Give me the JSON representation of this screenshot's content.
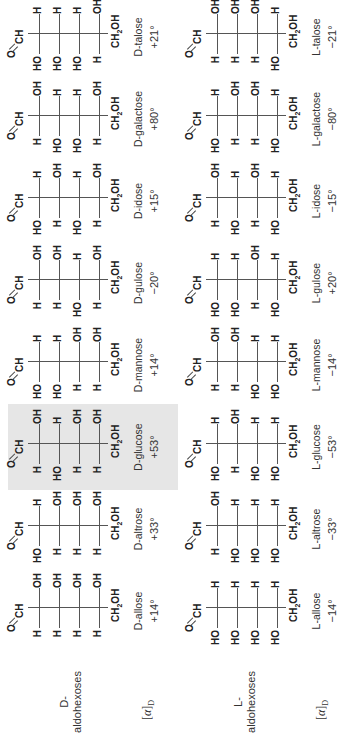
{
  "figure": {
    "row_labels": {
      "d": "D-\naldohexoses",
      "l": "L-\naldohexoses"
    },
    "rotation_label": "[α]D",
    "highlighted": "D-glucose",
    "d_series": [
      {
        "name": "D-allose",
        "rotation": "+14°",
        "centers": [
          [
            "H",
            "OH"
          ],
          [
            "H",
            "OH"
          ],
          [
            "H",
            "OH"
          ],
          [
            "H",
            "OH"
          ]
        ]
      },
      {
        "name": "D-altrose",
        "rotation": "+33°",
        "centers": [
          [
            "HO",
            "H"
          ],
          [
            "H",
            "OH"
          ],
          [
            "H",
            "OH"
          ],
          [
            "H",
            "OH"
          ]
        ]
      },
      {
        "name": "D-glucose",
        "rotation": "+53°",
        "centers": [
          [
            "H",
            "OH"
          ],
          [
            "HO",
            "H"
          ],
          [
            "H",
            "OH"
          ],
          [
            "H",
            "OH"
          ]
        ]
      },
      {
        "name": "D-mannose",
        "rotation": "+14°",
        "centers": [
          [
            "HO",
            "H"
          ],
          [
            "HO",
            "H"
          ],
          [
            "H",
            "OH"
          ],
          [
            "H",
            "OH"
          ]
        ]
      },
      {
        "name": "D-gulose",
        "rotation": "−20°",
        "centers": [
          [
            "H",
            "OH"
          ],
          [
            "H",
            "OH"
          ],
          [
            "HO",
            "H"
          ],
          [
            "H",
            "OH"
          ]
        ]
      },
      {
        "name": "D-idose",
        "rotation": "+15°",
        "centers": [
          [
            "HO",
            "H"
          ],
          [
            "H",
            "OH"
          ],
          [
            "HO",
            "H"
          ],
          [
            "H",
            "OH"
          ]
        ]
      },
      {
        "name": "D-galactose",
        "rotation": "+80°",
        "centers": [
          [
            "H",
            "OH"
          ],
          [
            "HO",
            "H"
          ],
          [
            "HO",
            "H"
          ],
          [
            "H",
            "OH"
          ]
        ]
      },
      {
        "name": "D-talose",
        "rotation": "+21°",
        "centers": [
          [
            "HO",
            "H"
          ],
          [
            "HO",
            "H"
          ],
          [
            "HO",
            "H"
          ],
          [
            "H",
            "OH"
          ]
        ]
      }
    ],
    "l_series": [
      {
        "name": "L-allose",
        "rotation": "−14°",
        "centers": [
          [
            "HO",
            "H"
          ],
          [
            "HO",
            "H"
          ],
          [
            "HO",
            "H"
          ],
          [
            "HO",
            "H"
          ]
        ]
      },
      {
        "name": "L-altrose",
        "rotation": "−33°",
        "centers": [
          [
            "H",
            "OH"
          ],
          [
            "HO",
            "H"
          ],
          [
            "HO",
            "H"
          ],
          [
            "HO",
            "H"
          ]
        ]
      },
      {
        "name": "L-glucose",
        "rotation": "−53°",
        "centers": [
          [
            "HO",
            "H"
          ],
          [
            "H",
            "OH"
          ],
          [
            "HO",
            "H"
          ],
          [
            "HO",
            "H"
          ]
        ]
      },
      {
        "name": "L-mannose",
        "rotation": "−14°",
        "centers": [
          [
            "H",
            "OH"
          ],
          [
            "H",
            "OH"
          ],
          [
            "HO",
            "H"
          ],
          [
            "HO",
            "H"
          ]
        ]
      },
      {
        "name": "L-gulose",
        "rotation": "+20°",
        "centers": [
          [
            "HO",
            "H"
          ],
          [
            "HO",
            "H"
          ],
          [
            "H",
            "OH"
          ],
          [
            "HO",
            "H"
          ]
        ]
      },
      {
        "name": "L-idose",
        "rotation": "−15°",
        "centers": [
          [
            "H",
            "OH"
          ],
          [
            "HO",
            "H"
          ],
          [
            "H",
            "OH"
          ],
          [
            "HO",
            "H"
          ]
        ]
      },
      {
        "name": "L-galactose",
        "rotation": "−80°",
        "centers": [
          [
            "HO",
            "H"
          ],
          [
            "H",
            "OH"
          ],
          [
            "H",
            "OH"
          ],
          [
            "HO",
            "H"
          ]
        ]
      },
      {
        "name": "L-talose",
        "rotation": "−21°",
        "centers": [
          [
            "H",
            "OH"
          ],
          [
            "H",
            "OH"
          ],
          [
            "H",
            "OH"
          ],
          [
            "HO",
            "H"
          ]
        ]
      }
    ],
    "top_group": {
      "o": "O",
      "ch": "CH"
    },
    "bottom_group": {
      "ch": "CH",
      "sub": "2",
      "oh": "OH"
    }
  }
}
